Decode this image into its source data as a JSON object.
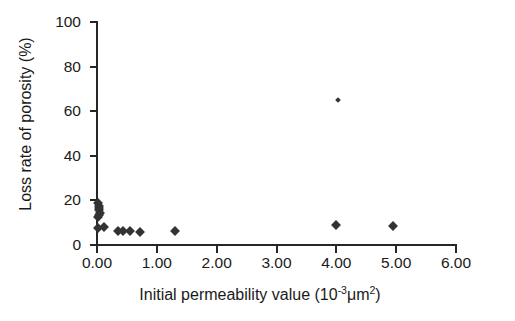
{
  "figure": {
    "background": "#ffffff",
    "marker_color": "#333333"
  },
  "axes": {
    "x_label_prefix": "Initial permeability value (10",
    "x_label_exponent": "-3",
    "x_label_mid": "μm",
    "x_label_exponent2": "2",
    "x_label_suffix": ")",
    "x_label_full": "Initial permeability value (10-3μm2)",
    "y_label": "Loss rate of porosity (%)",
    "x_ticks": [
      "0.00",
      "1.00",
      "2.00",
      "3.00",
      "4.00",
      "5.00",
      "6.00"
    ],
    "y_ticks": [
      "0",
      "20",
      "40",
      "60",
      "80",
      "100"
    ]
  },
  "chart_data": {
    "type": "scatter",
    "title": "",
    "xlabel": "Initial permeability value (10^-3 μm^2)",
    "ylabel": "Loss rate of porosity (%)",
    "xlim": [
      0.0,
      6.0
    ],
    "ylim": [
      0,
      100
    ],
    "xticks": [
      0.0,
      1.0,
      2.0,
      3.0,
      4.0,
      5.0,
      6.0
    ],
    "yticks": [
      0,
      20,
      40,
      60,
      80,
      100
    ],
    "grid": false,
    "legend": null,
    "series": [
      {
        "name": "samples",
        "marker": "diamond",
        "color": "#333333",
        "points": [
          {
            "x": 0.02,
            "y": 19.0
          },
          {
            "x": 0.03,
            "y": 17.5
          },
          {
            "x": 0.04,
            "y": 16.5
          },
          {
            "x": 0.03,
            "y": 15.5
          },
          {
            "x": 0.05,
            "y": 14.5
          },
          {
            "x": 0.04,
            "y": 13.5
          },
          {
            "x": 0.02,
            "y": 12.5
          },
          {
            "x": 0.01,
            "y": 7.5
          },
          {
            "x": 0.12,
            "y": 8.0
          },
          {
            "x": 0.35,
            "y": 6.5
          },
          {
            "x": 0.44,
            "y": 6.5
          },
          {
            "x": 0.55,
            "y": 6.5
          },
          {
            "x": 0.72,
            "y": 6.0
          },
          {
            "x": 1.3,
            "y": 6.5
          },
          {
            "x": 4.0,
            "y": 9.0
          },
          {
            "x": 4.95,
            "y": 8.5
          },
          {
            "x": 4.02,
            "y": 65.0
          }
        ]
      }
    ]
  }
}
